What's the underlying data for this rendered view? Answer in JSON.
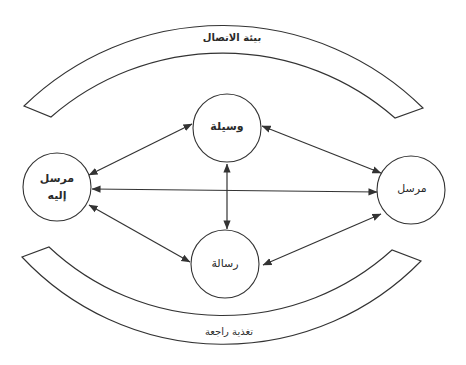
{
  "diagram": {
    "colors": {
      "stroke": "#333333",
      "background": "#ffffff",
      "text": "#2a2a2a"
    },
    "bands": {
      "top": {
        "label": "بيئة الاتصال",
        "meaning": "communication environment"
      },
      "bottom": {
        "label": "تغذية راجعة",
        "meaning": "feedback"
      }
    },
    "nodes": {
      "receiver": {
        "line1": "مرسل",
        "line2": "إليه",
        "meaning": "receiver"
      },
      "sender": {
        "label": "مرسل",
        "meaning": "sender"
      },
      "medium": {
        "label": "وسيلة",
        "meaning": "medium"
      },
      "message": {
        "label": "رسالة",
        "meaning": "message"
      }
    },
    "edges": [
      {
        "from": "receiver",
        "to": "medium",
        "type": "bidirectional"
      },
      {
        "from": "receiver",
        "to": "sender",
        "type": "bidirectional"
      },
      {
        "from": "receiver",
        "to": "message",
        "type": "bidirectional"
      },
      {
        "from": "medium",
        "to": "sender",
        "type": "bidirectional"
      },
      {
        "from": "medium",
        "to": "message",
        "type": "bidirectional"
      },
      {
        "from": "message",
        "to": "sender",
        "type": "bidirectional"
      }
    ]
  }
}
